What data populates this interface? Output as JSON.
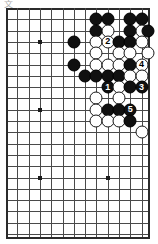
{
  "diagram": {
    "kind": "go-board-diagram",
    "corner_mark": "文",
    "board": {
      "columns": 13,
      "rows": 21,
      "left_px": 6,
      "top_px": 8,
      "step_px": 11.3,
      "right_edge_px": 148,
      "bottom_edge_px": 237,
      "line_color": "#4a4a4a",
      "edge_color": "#2b2b2b",
      "background_color": "#ffffff"
    },
    "star_points": [
      {
        "col": 3,
        "row": 3
      },
      {
        "col": 3,
        "row": 9
      },
      {
        "col": 3,
        "row": 15
      },
      {
        "col": 9,
        "row": 3
      },
      {
        "col": 9,
        "row": 15
      }
    ],
    "colors": {
      "black_stone": "#101010",
      "white_stone": "#ffffff",
      "black_label_text": "#ffffff",
      "white_label_text": "#000000"
    },
    "stones": [
      {
        "col": 8,
        "row": 1,
        "color": "black",
        "label": ""
      },
      {
        "col": 9,
        "row": 1,
        "color": "black",
        "label": ""
      },
      {
        "col": 11,
        "row": 1,
        "color": "black",
        "label": ""
      },
      {
        "col": 12,
        "row": 1,
        "color": "black",
        "label": ""
      },
      {
        "col": 8,
        "row": 2,
        "color": "black",
        "label": ""
      },
      {
        "col": 9,
        "row": 2,
        "color": "white",
        "label": ""
      },
      {
        "col": 11,
        "row": 2,
        "color": "black",
        "label": ""
      },
      {
        "col": 12,
        "row": 2,
        "color": "white",
        "label": ""
      },
      {
        "col": 13,
        "row": 2,
        "color": "black",
        "label": ""
      },
      {
        "col": 6,
        "row": 3,
        "color": "black",
        "label": ""
      },
      {
        "col": 8,
        "row": 3,
        "color": "white",
        "label": ""
      },
      {
        "col": 9,
        "row": 3,
        "color": "white",
        "label": "2"
      },
      {
        "col": 10,
        "row": 3,
        "color": "black",
        "label": ""
      },
      {
        "col": 11,
        "row": 3,
        "color": "black",
        "label": ""
      },
      {
        "col": 12,
        "row": 3,
        "color": "white",
        "label": ""
      },
      {
        "col": 8,
        "row": 4,
        "color": "white",
        "label": ""
      },
      {
        "col": 10,
        "row": 4,
        "color": "white",
        "label": ""
      },
      {
        "col": 11,
        "row": 4,
        "color": "white",
        "label": ""
      },
      {
        "col": 13,
        "row": 4,
        "color": "white",
        "label": ""
      },
      {
        "col": 6,
        "row": 5,
        "color": "black",
        "label": ""
      },
      {
        "col": 8,
        "row": 5,
        "color": "white",
        "label": ""
      },
      {
        "col": 9,
        "row": 5,
        "color": "white",
        "label": ""
      },
      {
        "col": 10,
        "row": 5,
        "color": "white",
        "label": ""
      },
      {
        "col": 11,
        "row": 5,
        "color": "black",
        "label": ""
      },
      {
        "col": 12,
        "row": 5,
        "color": "white",
        "label": "4"
      },
      {
        "col": 7,
        "row": 6,
        "color": "black",
        "label": ""
      },
      {
        "col": 8,
        "row": 6,
        "color": "black",
        "label": ""
      },
      {
        "col": 9,
        "row": 6,
        "color": "black",
        "label": ""
      },
      {
        "col": 10,
        "row": 6,
        "color": "black",
        "label": ""
      },
      {
        "col": 11,
        "row": 6,
        "color": "white",
        "label": ""
      },
      {
        "col": 12,
        "row": 6,
        "color": "white",
        "label": ""
      },
      {
        "col": 9,
        "row": 7,
        "color": "black",
        "label": "1"
      },
      {
        "col": 10,
        "row": 7,
        "color": "white",
        "label": ""
      },
      {
        "col": 11,
        "row": 7,
        "color": "black",
        "label": ""
      },
      {
        "col": 12,
        "row": 7,
        "color": "black",
        "label": "3"
      },
      {
        "col": 8,
        "row": 8,
        "color": "white",
        "label": ""
      },
      {
        "col": 10,
        "row": 8,
        "color": "white",
        "label": ""
      },
      {
        "col": 9,
        "row": 9,
        "color": "black",
        "label": ""
      },
      {
        "col": 10,
        "row": 9,
        "color": "black",
        "label": ""
      },
      {
        "col": 11,
        "row": 9,
        "color": "black",
        "label": "5"
      },
      {
        "col": 8,
        "row": 9,
        "color": "white",
        "label": ""
      },
      {
        "col": 8,
        "row": 10,
        "color": "white",
        "label": ""
      },
      {
        "col": 9,
        "row": 10,
        "color": "white",
        "label": ""
      },
      {
        "col": 10,
        "row": 10,
        "color": "white",
        "label": ""
      },
      {
        "col": 11,
        "row": 10,
        "color": "black",
        "label": ""
      },
      {
        "col": 12,
        "row": 11,
        "color": "white",
        "label": ""
      }
    ],
    "move_sequence": [
      {
        "number": "1",
        "color": "black"
      },
      {
        "number": "2",
        "color": "white"
      },
      {
        "number": "3",
        "color": "black"
      },
      {
        "number": "4",
        "color": "white"
      },
      {
        "number": "5",
        "color": "black"
      }
    ]
  }
}
